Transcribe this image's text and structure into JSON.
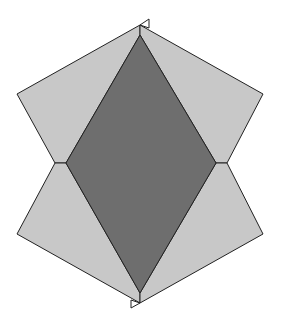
{
  "diagram": {
    "colors": {
      "background": "#ffffff",
      "light_fill": "#c8c8c8",
      "dark_fill": "#6e6e6e",
      "stroke": "#222222"
    },
    "shapes": {
      "rhombus": [
        [
          140,
          35
        ],
        [
          216,
          163
        ],
        [
          140,
          293
        ],
        [
          66,
          163
        ]
      ],
      "upper_left_quad": [
        [
          140,
          25
        ],
        [
          140,
          35
        ],
        [
          66,
          163
        ],
        [
          55,
          163
        ],
        [
          17,
          94
        ]
      ],
      "upper_right_quad": [
        [
          140,
          25
        ],
        [
          263,
          94
        ],
        [
          227,
          163
        ],
        [
          216,
          163
        ],
        [
          140,
          35
        ]
      ],
      "lower_left_quad": [
        [
          55,
          163
        ],
        [
          66,
          163
        ],
        [
          140,
          293
        ],
        [
          140,
          303
        ],
        [
          17,
          234
        ]
      ],
      "lower_right_quad": [
        [
          216,
          163
        ],
        [
          227,
          163
        ],
        [
          263,
          234
        ],
        [
          140,
          303
        ],
        [
          140,
          293
        ]
      ],
      "top_marker": [
        [
          140,
          25
        ],
        [
          149,
          19
        ],
        [
          149,
          28
        ]
      ],
      "bottom_marker": [
        [
          140,
          303
        ],
        [
          131,
          308
        ],
        [
          131,
          300
        ]
      ]
    }
  }
}
